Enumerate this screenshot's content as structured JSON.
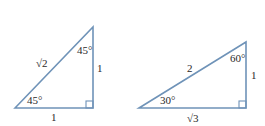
{
  "colors": {
    "stroke": "#6f93b8",
    "text": "#2a2a2a"
  },
  "triangles": [
    {
      "name": "45-45-90",
      "hypotenuse": "√2",
      "vertical_leg": "1",
      "horizontal_leg": "1",
      "top_angle": "45°",
      "bottom_angle": "45°"
    },
    {
      "name": "30-60-90",
      "hypotenuse": "2",
      "vertical_leg": "1",
      "horizontal_leg": "√3",
      "top_angle": "60°",
      "bottom_angle": "30°"
    }
  ]
}
